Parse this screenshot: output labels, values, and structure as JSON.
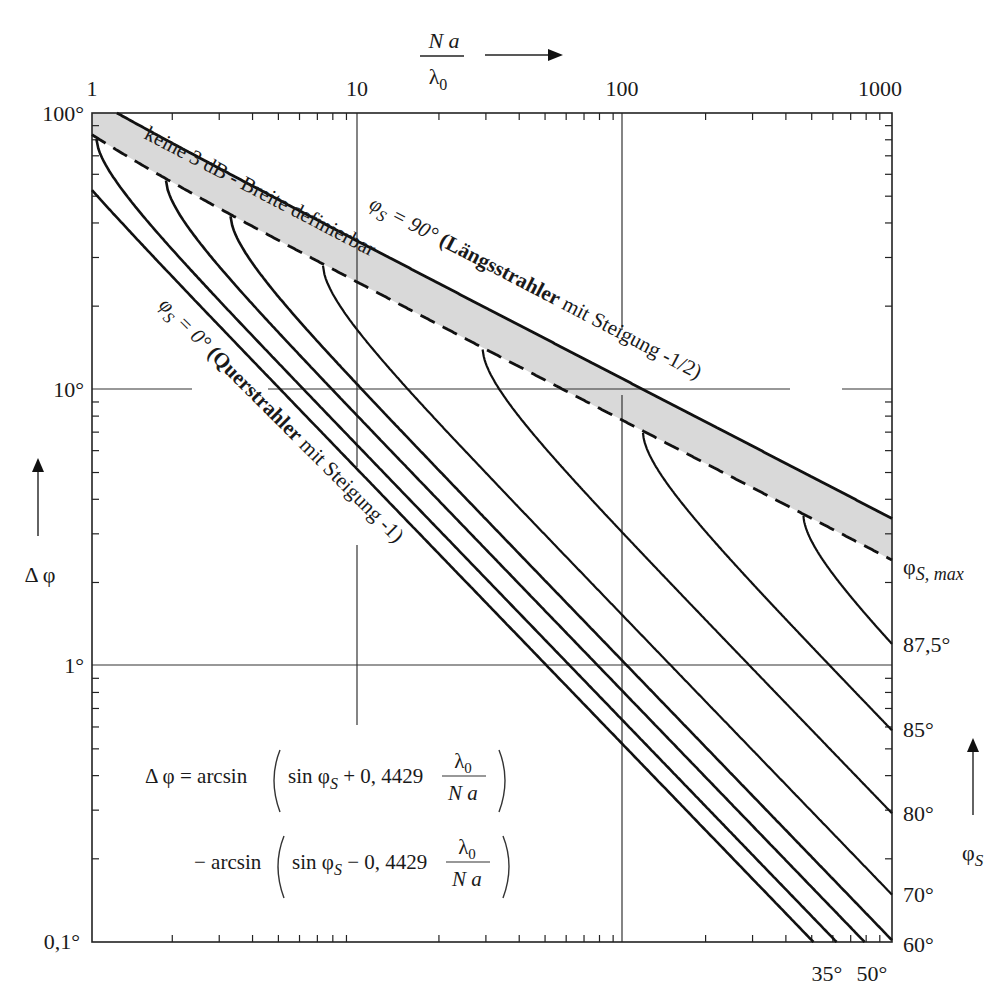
{
  "chart_data": {
    "type": "line",
    "title": "",
    "xscale": "log",
    "yscale": "log",
    "xlabel": "N a / λ0",
    "ylabel": "Δφ",
    "xlim": [
      1,
      1000
    ],
    "ylim": [
      0.1,
      100
    ],
    "x_ticks": [
      "1",
      "10",
      "100",
      "1000"
    ],
    "y_ticks": [
      "100°",
      "10°",
      "1°",
      "0,1°"
    ],
    "grid": "major decades only (partially interrupted by labels)",
    "formula_constant": 0.4429,
    "series": [
      {
        "name": "φS = 90° (Längsstrahler mit Steigung -1/2)",
        "style": "solid",
        "phi_s": 90,
        "points": [
          [
            1.0,
            112.3
          ],
          [
            10,
            34.0
          ],
          [
            100,
            10.8
          ],
          [
            1000,
            3.41
          ]
        ]
      },
      {
        "name": "φS,max (Grenze: keine 3 dB - Breite definierbar)",
        "style": "dashed",
        "phi_s": "max",
        "points": [
          [
            1.0,
            83.4
          ],
          [
            10,
            24.2
          ],
          [
            100,
            7.63
          ],
          [
            1000,
            2.41
          ]
        ]
      },
      {
        "name": "φS = 87,5°",
        "phi_s": 87.5,
        "points": [
          [
            465,
            3.53
          ],
          [
            1000,
            1.26
          ]
        ]
      },
      {
        "name": "φS = 85°",
        "phi_s": 85,
        "points": [
          [
            116,
            7.1
          ],
          [
            1000,
            0.58
          ]
        ]
      },
      {
        "name": "φS = 80°",
        "phi_s": 80,
        "points": [
          [
            29.1,
            14.5
          ],
          [
            100,
            2.92
          ],
          [
            1000,
            0.29
          ]
        ]
      },
      {
        "name": "φS = 70°",
        "phi_s": 70,
        "points": [
          [
            7.34,
            29.0
          ],
          [
            10,
            16.6
          ],
          [
            100,
            1.48
          ],
          [
            1000,
            0.148
          ]
        ]
      },
      {
        "name": "φS = 60°",
        "phi_s": 60,
        "points": [
          [
            3.31,
            42.3
          ],
          [
            10,
            10.5
          ],
          [
            100,
            1.02
          ],
          [
            1000,
            0.102
          ]
        ]
      },
      {
        "name": "φS = 50°",
        "phi_s": 50,
        "points": [
          [
            1.89,
            57.0
          ],
          [
            10,
            7.97
          ],
          [
            100,
            0.79
          ],
          [
            1000,
            0.079
          ]
        ]
      },
      {
        "name": "φS = 35°",
        "phi_s": 35,
        "points": [
          [
            1.04,
            79.0
          ],
          [
            10,
            6.21
          ],
          [
            100,
            0.62
          ],
          [
            1000,
            0.062
          ]
        ]
      },
      {
        "name": "φS = 0° (Querstrahler mit Steigung -1)",
        "phi_s": 0,
        "points": [
          [
            1,
            52.6
          ],
          [
            10,
            5.08
          ],
          [
            100,
            0.508
          ],
          [
            1000,
            0.0508
          ]
        ]
      }
    ],
    "annotations": [
      "keine 3 dB - Breite definierbar",
      "φS = 90° (Längsstrahler mit Steigung -1/2)",
      "φS = 0° (Querstrahler mit Steigung -1)",
      "φS,max",
      "Δφ = arcsin(sin φS + 0,4429 λ0/(N a)) − arcsin(sin φS − 0,4429 λ0/(N a))"
    ],
    "right_labels": [
      "φS,max",
      "87,5°",
      "85°",
      "80°",
      "70°",
      "60°"
    ],
    "bottom_labels": [
      "35°",
      "50°"
    ],
    "right_axis_label": "φS",
    "band_fill": "#d9d9d9"
  },
  "labels": {
    "x_axis_num": "N a",
    "x_axis_den": "λ",
    "x_axis_den_sub": "0",
    "y_axis": "Δ φ",
    "right_axis": "φ",
    "right_axis_sub": "S",
    "x_ticks": [
      "1",
      "10",
      "100",
      "1000"
    ],
    "y_ticks": [
      "100°",
      "10°",
      "1°",
      "0,1°"
    ],
    "band_text": "keine 3 dB - Breite definierbar",
    "phi90_prefix": "φ",
    "phi90_sub": "S",
    "phi90_eq": " = 90° ",
    "phi90_bold": "(Längsstrahler",
    "phi90_rest": " mit Steigung -1/2)",
    "phi0_prefix": "φ",
    "phi0_sub": "S",
    "phi0_eq": " = 0° ",
    "phi0_bold": "(Querstrahler",
    "phi0_rest": " mit Steigung -1)",
    "phimax": "φ",
    "phimax_sub": "S, max",
    "right_vals": [
      "87,5°",
      "85°",
      "80°",
      "70°",
      "60°"
    ],
    "bottom_vals": [
      "35°",
      "50°"
    ],
    "formula_l1_a": "Δ φ = arcsin",
    "formula_l1_b": "sin φ",
    "formula_sub": "S",
    "formula_l1_c": " + 0, 4429",
    "formula_l2_a": "− arcsin",
    "formula_l2_c": " − 0, 4429",
    "frac_num": "λ",
    "frac_num_sub": "0",
    "frac_den": "N  a"
  },
  "style": {
    "line_color": "#111111",
    "grid_color": "#333333",
    "band_fill": "#d9d9d9",
    "curve_phis": [
      0,
      35,
      50,
      60,
      70,
      80,
      85,
      87.5
    ]
  }
}
